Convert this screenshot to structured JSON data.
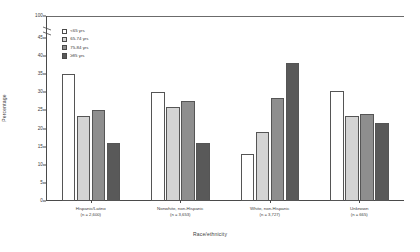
{
  "chart_data": {
    "type": "bar",
    "title": "",
    "xlabel": "Race/ethnicity",
    "ylabel": "Percentage",
    "ylim": [
      0,
      100
    ],
    "yticks": [
      0,
      5,
      10,
      15,
      20,
      25,
      30,
      35,
      40,
      45,
      100
    ],
    "ytick_labels": [
      "0",
      "5",
      "10",
      "15",
      "20",
      "25",
      "30",
      "35",
      "40",
      "45",
      "100"
    ],
    "axis_break": {
      "present": true,
      "between": [
        45,
        100
      ]
    },
    "grid": false,
    "legend_position": "upper-left-inside",
    "categories": [
      "Hispanic/Latino",
      "Nonwhite, non-Hispanic",
      "White, non-Hispanic",
      "Unknown"
    ],
    "category_counts": [
      "(n = 2,600)",
      "(n = 3,653)",
      "(n = 3,727)",
      "(n = 665)"
    ],
    "series": [
      {
        "name": "<65 yrs",
        "color": "#ffffff",
        "values": [
          35.0,
          30.0,
          13.0,
          30.5
        ]
      },
      {
        "name": "65-74 yrs",
        "color": "#d4d4d4",
        "values": [
          23.5,
          26.0,
          19.0,
          23.5
        ]
      },
      {
        "name": "75-84 yrs",
        "color": "#8e8e8e",
        "values": [
          25.0,
          27.5,
          28.5,
          24.0
        ]
      },
      {
        "name": "≥85 yrs",
        "color": "#595959",
        "values": [
          16.0,
          16.0,
          38.0,
          21.5
        ]
      }
    ]
  },
  "figure": {
    "axis_color": "#4a4a4a",
    "text_color": "#3b3b3b",
    "background": "#ffffff"
  }
}
